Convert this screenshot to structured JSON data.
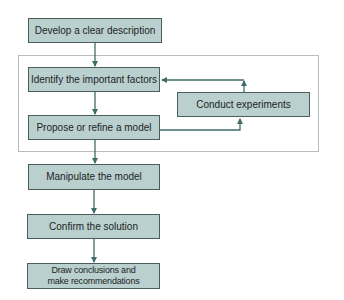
{
  "diagram": {
    "type": "flowchart",
    "colors": {
      "box_fill": "#b9d0cf",
      "box_border": "#4a5c5b",
      "arrow": "#3f6e68",
      "frame_border": "#b8bcbc",
      "text": "#1c2424"
    },
    "nodes": {
      "describe": {
        "label": "Develop a clear description"
      },
      "identify": {
        "label": "Identify the important factors"
      },
      "experiment": {
        "label": "Conduct experiments"
      },
      "propose": {
        "label": "Propose or refine a model"
      },
      "manipulate": {
        "label": "Manipulate the model"
      },
      "confirm": {
        "label": "Confirm the solution"
      },
      "conclude": {
        "label_line1": "Draw conclusions and",
        "label_line2": "make recommendations"
      }
    },
    "edges": [
      {
        "from": "describe",
        "to": "identify"
      },
      {
        "from": "identify",
        "to": "propose"
      },
      {
        "from": "propose",
        "to": "experiment"
      },
      {
        "from": "experiment",
        "to": "identify"
      },
      {
        "from": "propose",
        "to": "manipulate"
      },
      {
        "from": "manipulate",
        "to": "confirm"
      },
      {
        "from": "confirm",
        "to": "conclude"
      }
    ],
    "group": {
      "members": [
        "identify",
        "experiment",
        "propose"
      ]
    }
  }
}
